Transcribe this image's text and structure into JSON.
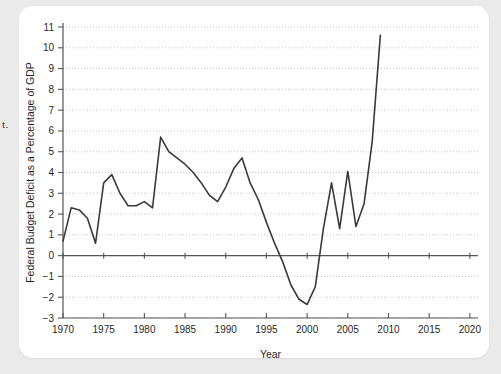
{
  "figure": {
    "margin_text": "t.",
    "background_color": "#eaeaea",
    "card_color": "#ffffff",
    "line_color": "#3a3a3a",
    "axis_color": "#555555",
    "grid_color": "#b9b9b9"
  },
  "chart_data": {
    "type": "line",
    "title": "",
    "xlabel": "Year",
    "ylabel": "Federal Budget Deficit as a Percentage of GDP",
    "xlim": [
      1970,
      2021
    ],
    "ylim": [
      -3,
      11
    ],
    "xticks": [
      1970,
      1975,
      1980,
      1985,
      1990,
      1995,
      2000,
      2005,
      2010,
      2015,
      2020
    ],
    "xtick_labels": [
      "1970",
      "1975",
      "1980",
      "1985",
      "1990",
      "1995",
      "2000",
      "2005",
      "2010",
      "2015",
      "2020"
    ],
    "yticks": [
      -3,
      -2,
      -1,
      0,
      1,
      2,
      3,
      4,
      5,
      6,
      7,
      8,
      9,
      10,
      11
    ],
    "ytick_labels": [
      "−3",
      "−2",
      "−1",
      "0",
      "1",
      "2",
      "3",
      "4",
      "5",
      "6",
      "7",
      "8",
      "9",
      "10",
      "11"
    ],
    "grid": true,
    "grid_axis": "y",
    "legend": false,
    "zero_line": 0,
    "x": [
      1970,
      1971,
      1972,
      1973,
      1974,
      1975,
      1976,
      1977,
      1978,
      1979,
      1980,
      1981,
      1982,
      1983,
      1984,
      1985,
      1986,
      1987,
      1988,
      1989,
      1990,
      1991,
      1992,
      1993,
      1994,
      1995,
      1996,
      1997,
      1998,
      1999,
      2000,
      2001,
      2002,
      2003,
      2004,
      2005,
      2006,
      2007,
      2008,
      2009
    ],
    "values": [
      0.7,
      2.3,
      2.2,
      1.8,
      0.6,
      3.5,
      3.9,
      3.0,
      2.4,
      2.4,
      2.6,
      2.3,
      5.7,
      5.0,
      4.7,
      4.4,
      4.0,
      3.5,
      2.9,
      2.6,
      3.3,
      4.2,
      4.7,
      3.5,
      2.7,
      1.6,
      0.6,
      -0.3,
      -1.4,
      -2.1,
      -2.35,
      -1.5,
      1.3,
      3.5,
      1.3,
      4.05,
      1.4,
      2.5,
      5.5,
      10.6
    ]
  }
}
